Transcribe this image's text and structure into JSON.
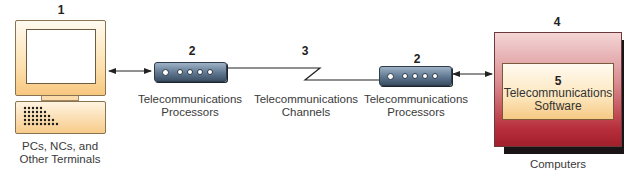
{
  "diagram": {
    "nodes": [
      {
        "id": "1",
        "number": "1",
        "label_lines": [
          "PCs, NCs, and",
          "Other Terminals"
        ],
        "icon": "terminal-icon"
      },
      {
        "id": "2a",
        "number": "2",
        "label_lines": [
          "Telecommunications",
          "Processors"
        ],
        "icon": "processor-icon"
      },
      {
        "id": "3",
        "number": "3",
        "label_lines": [
          "Telecommunications",
          "Channels"
        ],
        "icon": "channel-zigzag"
      },
      {
        "id": "2b",
        "number": "2",
        "label_lines": [
          "Telecommunications",
          "Processors"
        ],
        "icon": "processor-icon"
      },
      {
        "id": "4",
        "number": "4",
        "label_lines": [
          "Computers"
        ],
        "icon": "computer-box"
      },
      {
        "id": "5",
        "number": "5",
        "label_lines": [
          "Telecommunications",
          "Software"
        ],
        "icon": "software-box"
      }
    ],
    "edges": [
      {
        "from": "1",
        "to": "2a",
        "type": "bidirectional-arrow"
      },
      {
        "from": "2a",
        "to": "2b",
        "type": "channel-line"
      },
      {
        "from": "2b",
        "to": "4",
        "type": "bidirectional-arrow"
      }
    ],
    "colors": {
      "terminal_fill": "#f8cb89",
      "processor_fill": "#5f7790",
      "computer_fill": "#b72e3b",
      "software_fill": "#fde6bd"
    }
  }
}
